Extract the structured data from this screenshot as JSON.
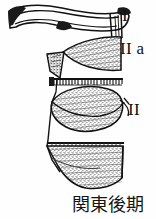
{
  "figure": {
    "name": "pottery-profile-drawing",
    "background_color": "#fefefe",
    "ink_color": "#111111",
    "stipple_color": "#3a3a3a"
  },
  "labels": [
    {
      "id": "I",
      "text": "I",
      "target": "upper-rim-band"
    },
    {
      "id": "IIa",
      "text": "II a",
      "target": "upper-stippled-body"
    },
    {
      "id": "II",
      "text": "II",
      "target": "lower-stippled-body"
    }
  ],
  "caption": {
    "text": "関東後期",
    "romanization_not_shown": null
  },
  "parts": {
    "rim": "curved-horizontal-rim-bar",
    "serrated_band": "comb-tooth-hatched-line",
    "upper_body": "stippled-lens-shape",
    "mid_body": "stippled-oval-shape",
    "lower_body": "stippled-wedge-shape"
  }
}
